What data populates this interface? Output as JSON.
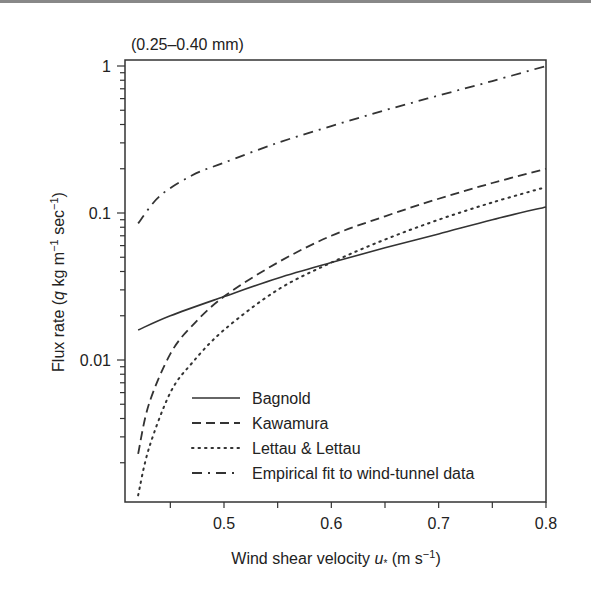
{
  "chart_data": {
    "type": "line",
    "title": "(0.25–0.40 mm)",
    "xlabel": "Wind shear velocity u* (m s−1)",
    "ylabel": "Flux rate (q kg m−1 sec−1)",
    "xscale": "linear",
    "yscale": "log",
    "xlim": [
      0.42,
      0.8
    ],
    "ylim": [
      0.001,
      1
    ],
    "xticks": [
      0.5,
      0.6,
      0.7,
      0.8
    ],
    "xtick_labels": [
      "0.5",
      "0.6",
      "0.7",
      "0.8"
    ],
    "yticks": [
      0.01,
      0.1,
      1
    ],
    "ytick_labels": [
      "0.01",
      "0.1",
      "1"
    ],
    "grid": false,
    "legend_position": "lower right",
    "series": [
      {
        "name": "Bagnold",
        "style": "solid",
        "x": [
          0.42,
          0.45,
          0.5,
          0.55,
          0.6,
          0.65,
          0.7,
          0.75,
          0.8
        ],
        "y": [
          0.016,
          0.02,
          0.027,
          0.036,
          0.046,
          0.058,
          0.072,
          0.09,
          0.11
        ]
      },
      {
        "name": "Kawamura",
        "style": "dashed",
        "x": [
          0.42,
          0.43,
          0.45,
          0.47,
          0.5,
          0.55,
          0.6,
          0.65,
          0.7,
          0.75,
          0.8
        ],
        "y": [
          0.0023,
          0.005,
          0.011,
          0.017,
          0.027,
          0.046,
          0.07,
          0.095,
          0.125,
          0.16,
          0.2
        ]
      },
      {
        "name": "Lettau & Lettau",
        "style": "dotted",
        "x": [
          0.42,
          0.43,
          0.45,
          0.47,
          0.5,
          0.55,
          0.6,
          0.65,
          0.7,
          0.75,
          0.8
        ],
        "y": [
          0.0012,
          0.0025,
          0.006,
          0.0095,
          0.016,
          0.03,
          0.046,
          0.066,
          0.09,
          0.118,
          0.15
        ]
      },
      {
        "name": "Empirical fit to wind-tunnel data",
        "style": "dashdot",
        "x": [
          0.42,
          0.44,
          0.47,
          0.5,
          0.55,
          0.6,
          0.65,
          0.7,
          0.75,
          0.8
        ],
        "y": [
          0.085,
          0.13,
          0.18,
          0.22,
          0.3,
          0.39,
          0.5,
          0.63,
          0.79,
          1.0
        ]
      }
    ]
  },
  "labels": {
    "title": "(0.25–0.40 mm)",
    "ylabel_pre": "Flux rate (",
    "ylabel_q": "q",
    "ylabel_mid": " kg m",
    "ylabel_sup1": "−1",
    "ylabel_sec": " sec",
    "ylabel_sup2": "−1",
    "ylabel_post": ")",
    "xlabel_pre": "Wind shear velocity ",
    "xlabel_u": "u",
    "xlabel_sub": "*",
    "xlabel_mid": " (m s",
    "xlabel_sup": "−1",
    "xlabel_post": ")"
  }
}
